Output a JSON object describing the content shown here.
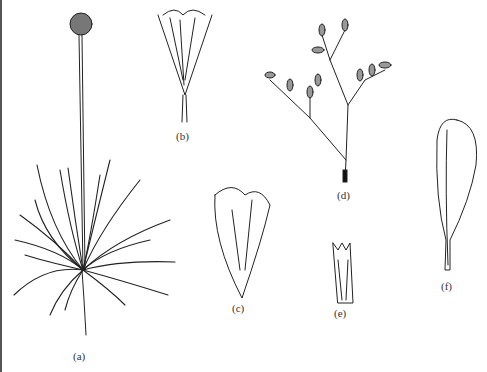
{
  "figure": {
    "panels": [
      {
        "id": "a",
        "label": "(a)",
        "subject": "whole plant with basal rosette of narrow leaves and globular flower head on long stalk"
      },
      {
        "id": "b",
        "label": "(b)",
        "subject": "single flower with hairy calyx"
      },
      {
        "id": "c",
        "label": "(c)",
        "subject": "petal / corolla lobes"
      },
      {
        "id": "d",
        "label": "(d)",
        "subject": "branched inflorescence"
      },
      {
        "id": "e",
        "label": "(e)",
        "subject": "calyx"
      },
      {
        "id": "f",
        "label": "(f)",
        "subject": "spathulate leaf"
      }
    ]
  }
}
